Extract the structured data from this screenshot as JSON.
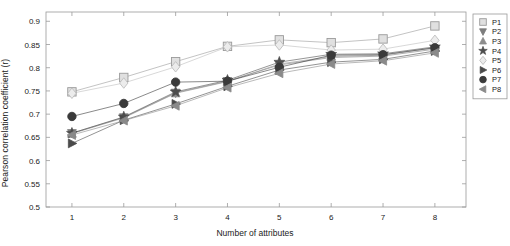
{
  "chart_data": {
    "type": "line",
    "title": "",
    "xlabel": "Number of attributes",
    "ylabel": "Pearson correlation coefficient (r)",
    "x": [
      1,
      2,
      3,
      4,
      5,
      6,
      7,
      8
    ],
    "xlim": [
      0.5,
      8.6
    ],
    "ylim": [
      0.5,
      0.92
    ],
    "yticks": [
      "0.5",
      "0.55",
      "0.6",
      "0.65",
      "0.7",
      "0.75",
      "0.8",
      "0.85",
      "0.9"
    ],
    "ytick_values": [
      0.5,
      0.55,
      0.6,
      0.65,
      0.7,
      0.75,
      0.8,
      0.85,
      0.9
    ],
    "xticks": [
      "1",
      "2",
      "3",
      "4",
      "5",
      "6",
      "7",
      "8"
    ],
    "grid": false,
    "legend_position": "right-outside",
    "series": [
      {
        "name": "P1",
        "marker": "square",
        "color": "#9a9a9a",
        "values": [
          0.748,
          0.779,
          0.813,
          0.846,
          0.86,
          0.854,
          0.862,
          0.89
        ]
      },
      {
        "name": "P2",
        "marker": "triangle-down",
        "color": "#7d7d7d",
        "values": [
          0.659,
          0.693,
          0.746,
          0.771,
          0.806,
          0.822,
          0.825,
          0.84
        ]
      },
      {
        "name": "P3",
        "marker": "triangle-up",
        "color": "#8c8c8c",
        "values": [
          0.658,
          0.692,
          0.745,
          0.77,
          0.808,
          0.824,
          0.827,
          0.843
        ]
      },
      {
        "name": "P4",
        "marker": "star",
        "color": "#4d4d4d",
        "values": [
          0.659,
          0.694,
          0.748,
          0.773,
          0.812,
          0.829,
          0.83,
          0.845
        ]
      },
      {
        "name": "P5",
        "marker": "diamond",
        "color": "#bdbdbd",
        "values": [
          0.745,
          0.767,
          0.802,
          0.845,
          0.849,
          0.838,
          0.84,
          0.859
        ]
      },
      {
        "name": "P6",
        "marker": "triangle-right",
        "color": "#4a4a4a",
        "values": [
          0.637,
          0.687,
          0.722,
          0.76,
          0.795,
          0.812,
          0.818,
          0.836
        ]
      },
      {
        "name": "P7",
        "marker": "circle",
        "color": "#3a3a3a",
        "values": [
          0.695,
          0.723,
          0.769,
          0.771,
          0.801,
          0.827,
          0.828,
          0.843
        ]
      },
      {
        "name": "P8",
        "marker": "triangle-left",
        "color": "#8a8a8a",
        "values": [
          0.655,
          0.686,
          0.718,
          0.757,
          0.788,
          0.808,
          0.815,
          0.832
        ]
      }
    ]
  },
  "legend": {
    "items": [
      {
        "label": "P1"
      },
      {
        "label": "P2"
      },
      {
        "label": "P3"
      },
      {
        "label": "P4"
      },
      {
        "label": "P5"
      },
      {
        "label": "P6"
      },
      {
        "label": "P7"
      },
      {
        "label": "P8"
      }
    ]
  }
}
